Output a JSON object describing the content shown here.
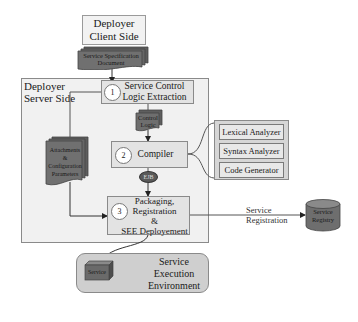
{
  "diagram": {
    "client": {
      "title_line1": "Deployer",
      "title_line2": "Client Side"
    },
    "spec_document": {
      "line1": "Service Specification",
      "line2": "Document"
    },
    "server": {
      "label_line1": "Deployer",
      "label_line2": "Server Side"
    },
    "steps": [
      {
        "number": "1",
        "line1": "Service Control",
        "line2": "Logic Extraction"
      },
      {
        "number": "2",
        "line1": "Compiler"
      },
      {
        "number": "3",
        "line1": "Packaging,",
        "line2": "Registration",
        "line3": "&",
        "line4": "SEE Deployement"
      }
    ],
    "control_logic": {
      "line1": "Control",
      "line2": "Logic"
    },
    "attachments": {
      "line1": "Attachments",
      "line2": "&",
      "line3": "Configuration",
      "line4": "Parameters"
    },
    "ejb": {
      "label": "EJB"
    },
    "compiler_parts": [
      "Lexical Analyzer",
      "Syntax Analyzer",
      "Code Generator"
    ],
    "registration_edge": {
      "line1": "Service",
      "line2": "Registration"
    },
    "registry": {
      "line1": "Service",
      "line2": "Registry"
    },
    "see": {
      "line1": "Service",
      "line2": "Execution",
      "line3": "Environment"
    },
    "service_component": {
      "label": "Service"
    }
  },
  "colors": {
    "box_fill": "#e3e3e3",
    "doc_fill": "#6b6b6b",
    "outer_fill": "#f1f1f1",
    "stroke": "#8a8a8a"
  }
}
